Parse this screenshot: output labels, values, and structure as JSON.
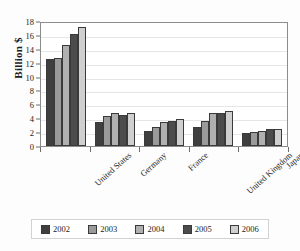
{
  "chart_data": {
    "type": "bar",
    "title": "",
    "subtitle": "",
    "xlabel": "",
    "ylabel": "Billion $",
    "ylim": [
      0,
      18
    ],
    "ytick_step": 2,
    "yticks": [
      "0",
      "2",
      "4",
      "6",
      "8",
      "10",
      "12",
      "14",
      "16",
      "18"
    ],
    "grid": true,
    "legend_position": "bottom",
    "categories": [
      "United States",
      "Germany",
      "France",
      "United Kingdom",
      "Japan"
    ],
    "series": [
      {
        "name": "2002",
        "color": "#3f3f3f",
        "values": [
          12.5,
          3.4,
          2.2,
          2.8,
          1.9
        ]
      },
      {
        "name": "2003",
        "color": "#9a9a9a",
        "values": [
          12.7,
          4.3,
          2.8,
          3.6,
          2.0
        ]
      },
      {
        "name": "2004",
        "color": "#b0b0b0",
        "values": [
          14.5,
          4.7,
          3.4,
          4.7,
          2.2
        ]
      },
      {
        "name": "2005",
        "color": "#4c4c4c",
        "values": [
          16.1,
          4.4,
          3.6,
          4.7,
          2.4
        ]
      },
      {
        "name": "2006",
        "color": "#cfcfcf",
        "values": [
          17.1,
          4.7,
          3.9,
          5.0,
          2.4
        ]
      }
    ]
  },
  "axis": {
    "y_title": "Billion $"
  },
  "legend": {
    "items": [
      {
        "label": "2002"
      },
      {
        "label": "2003"
      },
      {
        "label": "2004"
      },
      {
        "label": "2005"
      },
      {
        "label": "2006"
      }
    ]
  }
}
